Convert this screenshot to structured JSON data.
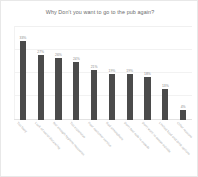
{
  "chart_data": {
    "type": "bar",
    "title": "Why Don't you want to go to the pub again?",
    "xlabel": "",
    "ylabel": "",
    "ylim": [
      0,
      35
    ],
    "grid": true,
    "legend": "none",
    "orientation": "vertical",
    "bar_color": "#4b4b4b",
    "value_label_suffix": "%",
    "categories": [
      "Too busy",
      "Lack of social distancing",
      "Not enough hygiene measures",
      "Too expensive",
      "Poor customer service",
      "Bad atmosphere",
      "Don't feel safe in crowds",
      "Don't want to queue outside",
      "Limited food and drink options",
      "Other reasons"
    ],
    "values": [
      33,
      27,
      26,
      24,
      21,
      19,
      19,
      18,
      13,
      4
    ],
    "value_labels": [
      "33%",
      "27%",
      "26%",
      "24%",
      "21%",
      "19%",
      "19%",
      "18%",
      "13%",
      "4%"
    ]
  },
  "figure": {
    "background_color": "#ffffff",
    "border_color": "#e8e8e8",
    "title_color": "#6b6b6b",
    "label_color": "#a8a8a8"
  }
}
